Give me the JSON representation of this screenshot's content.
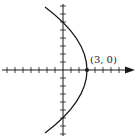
{
  "figure": {
    "vertex_label": "(3, 0)",
    "vertex": [
      3,
      0
    ],
    "equation_implied": "x = 3 - y^2/12",
    "x_axis": {
      "ticks_left": 8,
      "ticks_right": 6,
      "arrow": "right"
    },
    "y_axis": {
      "ticks_up": 8,
      "ticks_down": 8,
      "arrow": "none"
    },
    "y_intercepts": [
      6,
      -6
    ]
  },
  "colors": {
    "curve": "#1a1a1a",
    "axis": "#1a1a1a",
    "background": "#ffffff"
  }
}
